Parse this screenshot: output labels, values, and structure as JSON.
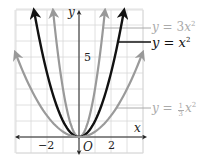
{
  "chart_data": {
    "type": "line",
    "title": "",
    "xlabel": "x",
    "ylabel": "y",
    "xlim": [
      -4,
      4
    ],
    "ylim": [
      -1,
      8
    ],
    "grid": true,
    "x_ticks": [
      {
        "value": -2,
        "label": "−2"
      },
      {
        "value": 2,
        "label": "2"
      }
    ],
    "y_ticks": [
      {
        "value": 5,
        "label": "5"
      }
    ],
    "origin_label": "O",
    "series": [
      {
        "name": "y = 3x²",
        "coef": 3,
        "color": "#999999",
        "width": 2.2
      },
      {
        "name": "y = x²",
        "coef": 1,
        "color": "#111111",
        "width": 2.4
      },
      {
        "name": "y = (1/3)x²",
        "coef": 0.3333,
        "color": "#9a9a9a",
        "width": 2.2
      }
    ],
    "annotations": [
      {
        "series": "y = 3x²",
        "text_y": "y",
        "eq": "=",
        "coef": "3",
        "var": "x",
        "power": "2",
        "color": "#aaaaaa"
      },
      {
        "series": "y = x²",
        "text_y": "y",
        "eq": "=",
        "coef": "",
        "var": "x",
        "power": "2",
        "color": "#111111"
      },
      {
        "series": "y = (1/3)x²",
        "text_y": "y",
        "eq": "=",
        "frac_num": "1",
        "frac_den": "3",
        "var": "x",
        "power": "2",
        "color": "#aaaaaa"
      }
    ]
  }
}
